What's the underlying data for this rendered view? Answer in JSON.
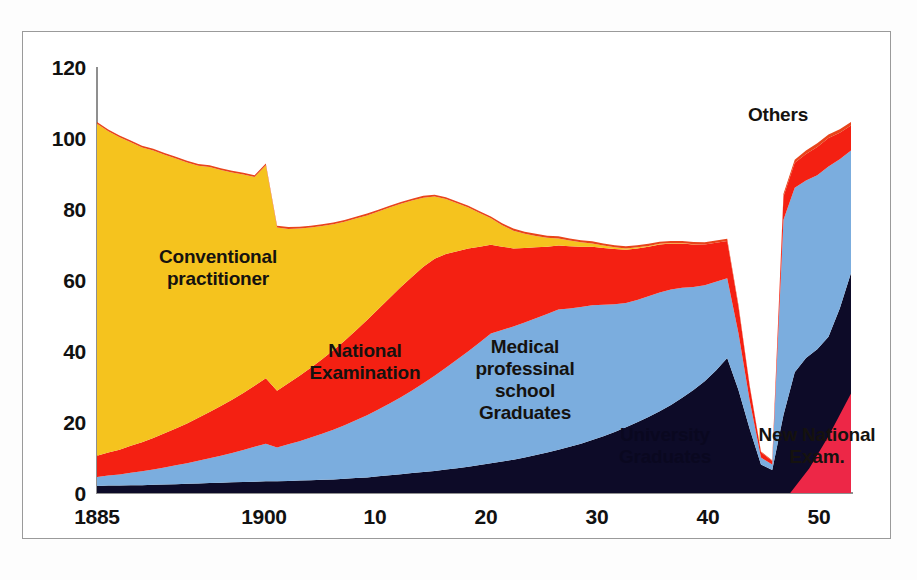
{
  "chart_data": {
    "type": "area",
    "stacked": true,
    "title": "",
    "subtitle": "",
    "xlabel": "",
    "ylabel": "",
    "xlim": [
      1885,
      1952
    ],
    "ylim": [
      0,
      120
    ],
    "ytick_values": [
      0,
      20,
      40,
      60,
      80,
      100,
      120
    ],
    "ytick_labels": [
      "0",
      "20",
      "40",
      "60",
      "80",
      "100",
      "120"
    ],
    "xtick_values": [
      1885,
      1900,
      1910,
      1920,
      1930,
      1940,
      1950
    ],
    "xtick_labels": [
      "1885",
      "1900",
      "10",
      "20",
      "30",
      "40",
      "50"
    ],
    "grid": false,
    "legend_position": "in-plot-annotations",
    "colors": {
      "conventional_practitioner": "#F5C31E",
      "national_examination": "#F42012",
      "medical_professional_school_graduates": "#7BADDE",
      "university_graduates": "#0D0B28",
      "others": "#E8441B",
      "new_national_exam": "#ED2747",
      "axis": "#8F8F8F",
      "text": "#15120F",
      "background": "#FFFFFF"
    },
    "annotations": [
      {
        "id": "conventional-practitioner",
        "text": "Conventional\npractitioner",
        "x": 1892.5,
        "y": 72,
        "color": "#15120F"
      },
      {
        "id": "national-examination",
        "text": "National\nExamination",
        "x": 1911.5,
        "y": 40,
        "color": "#15120F"
      },
      {
        "id": "medical-professional-school-graduates",
        "text": "Medical\nprofessinal\nschool\nGraduates",
        "x": 1922.5,
        "y": 35,
        "color": "#15120F"
      },
      {
        "id": "university-graduates",
        "text": "University\nGraduates",
        "x": 1936.0,
        "y": 13,
        "color": "#0A0820"
      },
      {
        "id": "new-national-exam",
        "text": "New National\nExam.",
        "x": 1947.0,
        "y": 13,
        "color": "#15120F"
      },
      {
        "id": "others",
        "text": "Others",
        "x": 1946.0,
        "y": 107,
        "color": "#15120F"
      }
    ],
    "x": [
      1885,
      1886,
      1887,
      1888,
      1889,
      1890,
      1891,
      1892,
      1893,
      1894,
      1895,
      1896,
      1897,
      1898,
      1899,
      1900,
      1901,
      1902,
      1903,
      1904,
      1905,
      1906,
      1907,
      1908,
      1909,
      1910,
      1911,
      1912,
      1913,
      1914,
      1915,
      1916,
      1917,
      1918,
      1919,
      1920,
      1921,
      1922,
      1923,
      1924,
      1925,
      1926,
      1927,
      1928,
      1929,
      1930,
      1931,
      1932,
      1933,
      1934,
      1935,
      1936,
      1937,
      1938,
      1939,
      1940,
      1941,
      1942,
      1943,
      1944,
      1945,
      1946,
      1947,
      1948,
      1949,
      1950,
      1951,
      1952
    ],
    "series": [
      {
        "name": "University Graduates",
        "key": "university_graduates",
        "color": "#0D0B28",
        "values": [
          2.0,
          2.1,
          2.1,
          2.2,
          2.2,
          2.3,
          2.4,
          2.5,
          2.6,
          2.7,
          2.8,
          2.9,
          3.0,
          3.1,
          3.2,
          3.3,
          3.3,
          3.4,
          3.5,
          3.6,
          3.7,
          3.8,
          4.0,
          4.2,
          4.4,
          4.7,
          5.0,
          5.3,
          5.6,
          5.9,
          6.2,
          6.6,
          7.0,
          7.4,
          7.9,
          8.4,
          8.9,
          9.4,
          10.0,
          10.7,
          11.4,
          12.2,
          13.0,
          13.9,
          14.9,
          16.0,
          17.2,
          18.5,
          19.9,
          21.4,
          23.0,
          24.8,
          26.8,
          29.0,
          31.5,
          34.5,
          38.0,
          29.0,
          18.0,
          8.0,
          6.5,
          22.0,
          34.0,
          38.0,
          40.5,
          44.0,
          52.0,
          62.0
        ]
      },
      {
        "name": "Medical professinal school Graduates",
        "key": "medical_professional_school_graduates",
        "color": "#7BADDE",
        "values": [
          2.5,
          2.8,
          3.1,
          3.5,
          3.9,
          4.3,
          4.8,
          5.3,
          5.8,
          6.4,
          7.0,
          7.6,
          8.3,
          9.0,
          9.8,
          10.6,
          9.5,
          10.3,
          11.1,
          12.0,
          13.0,
          14.0,
          15.1,
          16.3,
          17.5,
          18.8,
          20.2,
          21.7,
          23.3,
          25.0,
          26.8,
          28.7,
          30.6,
          32.5,
          34.5,
          36.5,
          37.0,
          37.5,
          38.0,
          38.5,
          39.0,
          39.5,
          39.0,
          38.5,
          38.0,
          37.0,
          36.0,
          35.0,
          34.5,
          34.0,
          33.5,
          32.5,
          31.0,
          29.0,
          27.0,
          25.0,
          22.5,
          16.0,
          8.0,
          2.0,
          1.5,
          55.0,
          52.0,
          50.0,
          49.0,
          48.0,
          42.0,
          34.5
        ]
      },
      {
        "name": "National Examination",
        "key": "national_examination",
        "color": "#F42012",
        "values": [
          6.0,
          6.5,
          7.0,
          7.6,
          8.2,
          8.9,
          9.6,
          10.4,
          11.2,
          12.1,
          13.0,
          14.0,
          15.0,
          16.1,
          17.2,
          18.4,
          16.0,
          17.2,
          18.4,
          19.7,
          21.0,
          22.4,
          23.8,
          25.3,
          26.8,
          28.3,
          29.7,
          31.0,
          32.0,
          32.8,
          33.0,
          32.0,
          30.5,
          29.0,
          27.0,
          25.0,
          23.5,
          22.0,
          21.0,
          20.0,
          19.0,
          18.0,
          17.5,
          17.0,
          16.5,
          16.0,
          15.5,
          15.0,
          14.5,
          14.0,
          13.5,
          13.0,
          12.5,
          12.0,
          11.5,
          11.0,
          10.5,
          7.5,
          4.0,
          1.5,
          1.0,
          6.5,
          7.0,
          7.5,
          8.0,
          8.0,
          7.5,
          7.0
        ]
      },
      {
        "name": "Conventional practitioner",
        "key": "conventional_practitioner",
        "color": "#F5C31E",
        "values": [
          93.5,
          90.5,
          88.0,
          85.5,
          83.0,
          81.0,
          78.5,
          76.0,
          73.5,
          71.0,
          69.0,
          66.5,
          64.0,
          61.5,
          58.8,
          60.0,
          46.0,
          43.5,
          41.5,
          39.5,
          37.5,
          35.5,
          33.5,
          31.5,
          29.5,
          27.5,
          25.5,
          23.5,
          21.5,
          19.5,
          17.5,
          15.5,
          13.5,
          11.5,
          9.5,
          7.5,
          6.0,
          5.0,
          4.0,
          3.2,
          2.5,
          2.0,
          1.6,
          1.2,
          0.9,
          0.7,
          0.5,
          0.4,
          0.3,
          0.2,
          0.2,
          0.1,
          0.1,
          0.1,
          0.0,
          0.0,
          0.0,
          0.0,
          0.0,
          0.0,
          0.0,
          0.0,
          0.0,
          0.0,
          0.0,
          0.0,
          0.0,
          0.0
        ]
      },
      {
        "name": "Others",
        "key": "others",
        "color": "#E8441B",
        "values": [
          0.5,
          0.5,
          0.5,
          0.5,
          0.5,
          0.5,
          0.5,
          0.5,
          0.5,
          0.5,
          0.5,
          0.5,
          0.5,
          0.5,
          0.5,
          0.5,
          0.5,
          0.5,
          0.5,
          0.5,
          0.5,
          0.5,
          0.5,
          0.5,
          0.5,
          0.5,
          0.5,
          0.5,
          0.5,
          0.5,
          0.5,
          0.5,
          0.5,
          0.5,
          0.5,
          0.5,
          0.6,
          0.6,
          0.6,
          0.6,
          0.6,
          0.6,
          0.6,
          0.6,
          0.6,
          0.6,
          0.6,
          0.6,
          0.6,
          0.6,
          0.6,
          0.6,
          0.6,
          0.6,
          0.6,
          0.6,
          0.6,
          0.5,
          0.3,
          0.2,
          0.2,
          0.8,
          0.9,
          1.0,
          1.0,
          1.0,
          1.0,
          1.0
        ]
      }
    ]
  }
}
